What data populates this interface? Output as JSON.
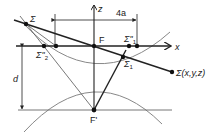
{
  "diagram": {
    "labels": {
      "z_axis": "z",
      "x_axis": "x",
      "focus_top": "F",
      "focus_bottom": "F'",
      "sigma_source": "Σ",
      "sigma_point": "Σ(x,y,z)",
      "sigma_1": "Σ",
      "sigma_1_sub": "1",
      "sigma_1_prime": "Σ''",
      "sigma_1_prime_sub": "1",
      "sigma_2_prime": "Σ''",
      "sigma_2_prime_sub": "2",
      "dimension_width": "4a",
      "dimension_depth": "d"
    },
    "colors": {
      "line": "#222222",
      "curve": "#888888"
    }
  }
}
